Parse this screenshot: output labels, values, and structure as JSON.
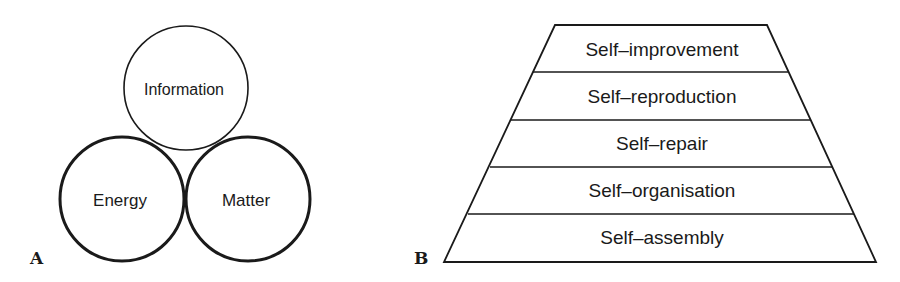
{
  "panel_a": {
    "label": "A",
    "circles": [
      {
        "name": "Information",
        "label": "Information"
      },
      {
        "name": "Energy",
        "label": "Energy"
      },
      {
        "name": "Matter",
        "label": "Matter"
      }
    ]
  },
  "panel_b": {
    "label": "B",
    "levels": [
      {
        "label": "Self–improvement"
      },
      {
        "label": "Self–reproduction"
      },
      {
        "label": "Self–repair"
      },
      {
        "label": "Self–organisation"
      },
      {
        "label": "Self–assembly"
      }
    ]
  }
}
